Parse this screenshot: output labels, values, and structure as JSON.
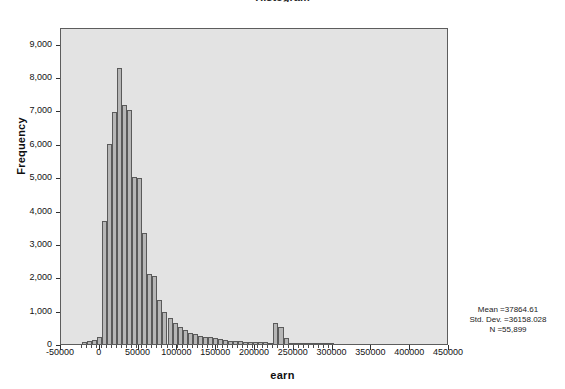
{
  "chart_data": {
    "type": "bar",
    "title": "Histogram",
    "xlabel": "earn",
    "ylabel": "Frequency",
    "xlim": [
      -50000,
      450000
    ],
    "ylim": [
      0,
      9500
    ],
    "grid": false,
    "legend": null,
    "bin_width": 6500,
    "x_tick_labels": [
      "-50000",
      "0",
      "50000",
      "100000",
      "150000",
      "200000",
      "250000",
      "300000",
      "350000",
      "400000",
      "450000"
    ],
    "x_tick_values": [
      -50000,
      0,
      50000,
      100000,
      150000,
      200000,
      250000,
      300000,
      350000,
      400000,
      450000
    ],
    "y_tick_labels": [
      "0",
      "1,000",
      "2,000",
      "3,000",
      "4,000",
      "5,000",
      "6,000",
      "7,000",
      "8,000",
      "9,000"
    ],
    "y_tick_values": [
      0,
      1000,
      2000,
      3000,
      4000,
      5000,
      6000,
      7000,
      8000,
      9000
    ],
    "bins": [
      {
        "x": -20000,
        "value": 60
      },
      {
        "x": -13500,
        "value": 80
      },
      {
        "x": -7000,
        "value": 110
      },
      {
        "x": -500,
        "value": 220
      },
      {
        "x": 6000,
        "value": 3700
      },
      {
        "x": 12500,
        "value": 6000
      },
      {
        "x": 19000,
        "value": 6950
      },
      {
        "x": 25500,
        "value": 8280
      },
      {
        "x": 32000,
        "value": 7150
      },
      {
        "x": 38500,
        "value": 7000
      },
      {
        "x": 45000,
        "value": 5020
      },
      {
        "x": 51500,
        "value": 4980
      },
      {
        "x": 58000,
        "value": 3330
      },
      {
        "x": 64500,
        "value": 2100
      },
      {
        "x": 71000,
        "value": 2050
      },
      {
        "x": 77500,
        "value": 1320
      },
      {
        "x": 84000,
        "value": 960
      },
      {
        "x": 90500,
        "value": 780
      },
      {
        "x": 97000,
        "value": 620
      },
      {
        "x": 103500,
        "value": 520
      },
      {
        "x": 110000,
        "value": 410
      },
      {
        "x": 116500,
        "value": 330
      },
      {
        "x": 123000,
        "value": 290
      },
      {
        "x": 129500,
        "value": 250
      },
      {
        "x": 136000,
        "value": 220
      },
      {
        "x": 142500,
        "value": 200
      },
      {
        "x": 149000,
        "value": 170
      },
      {
        "x": 155500,
        "value": 140
      },
      {
        "x": 162000,
        "value": 120
      },
      {
        "x": 168500,
        "value": 100
      },
      {
        "x": 175000,
        "value": 90
      },
      {
        "x": 181500,
        "value": 80
      },
      {
        "x": 188000,
        "value": 70
      },
      {
        "x": 194500,
        "value": 60
      },
      {
        "x": 201000,
        "value": 60
      },
      {
        "x": 207500,
        "value": 55
      },
      {
        "x": 214000,
        "value": 50
      },
      {
        "x": 220500,
        "value": 45
      },
      {
        "x": 227000,
        "value": 640
      },
      {
        "x": 233500,
        "value": 500
      },
      {
        "x": 240000,
        "value": 180
      },
      {
        "x": 246500,
        "value": 45
      },
      {
        "x": 253000,
        "value": 35
      },
      {
        "x": 259500,
        "value": 30
      },
      {
        "x": 266000,
        "value": 25
      },
      {
        "x": 272500,
        "value": 25
      },
      {
        "x": 279000,
        "value": 20
      },
      {
        "x": 285500,
        "value": 20
      },
      {
        "x": 292000,
        "value": 18
      },
      {
        "x": 298500,
        "value": 15
      }
    ]
  },
  "statistics": {
    "mean_label": "Mean =37864.61",
    "std_dev_label": "Std. Dev. =36158.028",
    "n_label": "N =55,899"
  },
  "colors": {
    "plot_background": "#e3e3e3",
    "bar_fill": "#b6b6b6",
    "bar_stroke": "#5a5a5a",
    "frame_stroke": "#5d5d5d",
    "page_background": "#ffffff"
  }
}
